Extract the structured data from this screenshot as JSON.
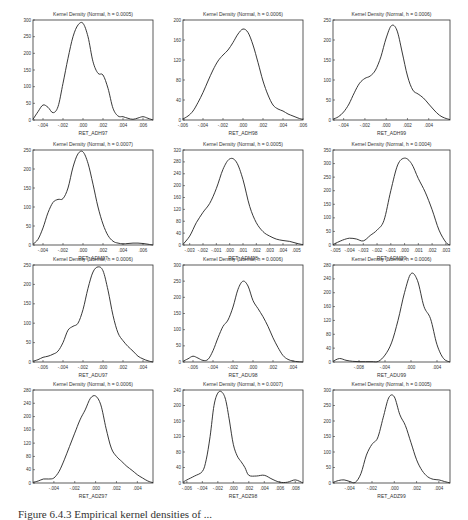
{
  "caption": "Figure 6.4.3 Empirical kernel densities of ...",
  "chart_data": [
    {
      "type": "line",
      "title": "Kernel Density (Normal, h = 0.0005)",
      "xlabel": "RET_ADH97",
      "ylabel": "",
      "xticks": [
        "-.004",
        "-.002",
        ".000",
        ".002",
        ".004",
        ".006"
      ],
      "xlim": [
        -0.005,
        0.007
      ],
      "yticks": [
        0,
        50,
        100,
        150,
        200,
        250,
        300
      ],
      "ylim": [
        0,
        300
      ],
      "x": [
        -0.005,
        -0.0045,
        -0.004,
        -0.0035,
        -0.003,
        -0.0025,
        -0.002,
        -0.0015,
        -0.001,
        -0.0005,
        0.0,
        0.0005,
        0.001,
        0.0015,
        0.002,
        0.0025,
        0.003,
        0.0035,
        0.004,
        0.0045,
        0.005,
        0.0055,
        0.006,
        0.0065,
        0.007
      ],
      "values": [
        2,
        25,
        45,
        38,
        22,
        40,
        110,
        185,
        250,
        285,
        290,
        250,
        175,
        140,
        135,
        95,
        35,
        12,
        10,
        5,
        2,
        6,
        10,
        5,
        0
      ]
    },
    {
      "type": "line",
      "title": "Kernel Density (Normal, h = 0.0006)",
      "xlabel": "RET_ADH98",
      "ylabel": "",
      "xticks": [
        "-.006",
        "-.004",
        "-.002",
        ".000",
        ".002",
        ".004",
        ".006"
      ],
      "xlim": [
        -0.006,
        0.006
      ],
      "yticks": [
        0,
        40,
        80,
        120,
        160,
        200
      ],
      "ylim": [
        0,
        200
      ],
      "x": [
        -0.006,
        -0.0055,
        -0.005,
        -0.0045,
        -0.004,
        -0.0035,
        -0.003,
        -0.0025,
        -0.002,
        -0.0015,
        -0.001,
        -0.0005,
        0.0,
        0.0005,
        0.001,
        0.0015,
        0.002,
        0.0025,
        0.003,
        0.0035,
        0.004,
        0.0045,
        0.005,
        0.0055,
        0.006
      ],
      "values": [
        2,
        8,
        18,
        35,
        55,
        78,
        100,
        118,
        130,
        140,
        155,
        172,
        182,
        175,
        150,
        115,
        78,
        50,
        30,
        22,
        18,
        12,
        8,
        4,
        1
      ]
    },
    {
      "type": "line",
      "title": "Kernel Density (Normal, h = 0.0006)",
      "xlabel": "RET_ADH99",
      "ylabel": "",
      "xticks": [
        "-.004",
        "-.002",
        ".000",
        ".002",
        ".004"
      ],
      "xlim": [
        -0.005,
        0.006
      ],
      "yticks": [
        0,
        50,
        100,
        150,
        200,
        250
      ],
      "ylim": [
        0,
        250
      ],
      "x": [
        -0.005,
        -0.0045,
        -0.004,
        -0.0035,
        -0.003,
        -0.0025,
        -0.002,
        -0.0015,
        -0.001,
        -0.0005,
        0.0,
        0.0005,
        0.001,
        0.0015,
        0.002,
        0.0025,
        0.003,
        0.0035,
        0.004,
        0.0045,
        0.005,
        0.0055,
        0.006
      ],
      "values": [
        2,
        8,
        20,
        40,
        68,
        92,
        104,
        110,
        125,
        158,
        205,
        236,
        225,
        170,
        110,
        75,
        65,
        55,
        40,
        25,
        12,
        5,
        1
      ]
    },
    {
      "type": "line",
      "title": "Kernel Density (Normal, h = 0.0007)",
      "xlabel": "RET_ADM97",
      "ylabel": "",
      "xticks": [
        "-.004",
        "-.002",
        ".000",
        ".002",
        ".004",
        ".006"
      ],
      "xlim": [
        -0.005,
        0.007
      ],
      "yticks": [
        0,
        50,
        100,
        150,
        200,
        250
      ],
      "ylim": [
        0,
        250
      ],
      "x": [
        -0.005,
        -0.0045,
        -0.004,
        -0.0035,
        -0.003,
        -0.0025,
        -0.002,
        -0.0015,
        -0.001,
        -0.0005,
        0.0,
        0.0005,
        0.001,
        0.0015,
        0.002,
        0.0025,
        0.003,
        0.0035,
        0.004,
        0.0045,
        0.005,
        0.0055,
        0.006,
        0.0065,
        0.007
      ],
      "values": [
        2,
        15,
        45,
        85,
        112,
        120,
        122,
        150,
        205,
        240,
        245,
        215,
        160,
        100,
        55,
        25,
        10,
        5,
        3,
        4,
        5,
        5,
        4,
        2,
        0
      ]
    },
    {
      "type": "line",
      "title": "Kernel Density (Normal, h = 0.0005)",
      "xlabel": "RET_ADM98",
      "ylabel": "",
      "xticks": [
        "-.003",
        "-.002",
        "-.001",
        ".000",
        ".001",
        ".002",
        ".003",
        ".004",
        ".005"
      ],
      "xlim": [
        -0.0035,
        0.0055
      ],
      "yticks": [
        0,
        40,
        80,
        120,
        160,
        200,
        240,
        280,
        320
      ],
      "ylim": [
        0,
        320
      ],
      "x": [
        -0.0035,
        -0.003,
        -0.0025,
        -0.002,
        -0.0015,
        -0.001,
        -0.0005,
        0.0,
        0.0005,
        0.001,
        0.0015,
        0.002,
        0.0025,
        0.003,
        0.0035,
        0.004,
        0.0045,
        0.005,
        0.0055
      ],
      "values": [
        2,
        30,
        75,
        110,
        140,
        190,
        255,
        290,
        280,
        220,
        130,
        75,
        45,
        30,
        20,
        15,
        12,
        6,
        1
      ]
    },
    {
      "type": "line",
      "title": "Kernel Density (Normal, h = 0.0004)",
      "xlabel": "RET_ADM99",
      "ylabel": "",
      "xticks": [
        "-.005",
        "-.004",
        "-.003",
        "-.002",
        "-.001",
        ".000",
        ".001",
        ".002",
        ".003"
      ],
      "xlim": [
        -0.0052,
        0.0033
      ],
      "yticks": [
        0,
        50,
        100,
        150,
        200,
        250,
        300,
        350
      ],
      "ylim": [
        0,
        350
      ],
      "x": [
        -0.0052,
        -0.0045,
        -0.004,
        -0.0035,
        -0.003,
        -0.0025,
        -0.002,
        -0.0015,
        -0.001,
        -0.0005,
        0.0,
        0.0005,
        0.001,
        0.0015,
        0.002,
        0.0025,
        0.003,
        0.0033
      ],
      "values": [
        2,
        18,
        25,
        22,
        15,
        35,
        55,
        90,
        200,
        295,
        320,
        300,
        245,
        195,
        130,
        55,
        10,
        0
      ]
    },
    {
      "type": "line",
      "title": "Kernel Density (Normal, h = 0.0006)",
      "xlabel": "RET_ADU97",
      "ylabel": "",
      "xticks": [
        "-.006",
        "-.004",
        "-.002",
        ".000",
        ".002",
        ".004"
      ],
      "xlim": [
        -0.007,
        0.005
      ],
      "yticks": [
        0,
        50,
        100,
        150,
        200,
        250
      ],
      "ylim": [
        0,
        250
      ],
      "x": [
        -0.007,
        -0.0065,
        -0.006,
        -0.0055,
        -0.005,
        -0.0045,
        -0.004,
        -0.0035,
        -0.003,
        -0.0025,
        -0.002,
        -0.0015,
        -0.001,
        -0.0005,
        0.0,
        0.0005,
        0.001,
        0.0015,
        0.002,
        0.0025,
        0.003,
        0.0035,
        0.004,
        0.0045,
        0.005
      ],
      "values": [
        2,
        6,
        12,
        15,
        20,
        28,
        50,
        82,
        92,
        100,
        135,
        190,
        232,
        245,
        235,
        185,
        120,
        75,
        55,
        40,
        28,
        15,
        8,
        3,
        0
      ]
    },
    {
      "type": "line",
      "title": "Kernel Density (Normal, h = 0.0006)",
      "xlabel": "RET_ADU98",
      "ylabel": "",
      "xticks": [
        "-.006",
        "-.004",
        "-.002",
        ".000",
        ".002",
        ".004"
      ],
      "xlim": [
        -0.007,
        0.005
      ],
      "yticks": [
        0,
        50,
        100,
        150,
        200,
        250,
        300
      ],
      "ylim": [
        0,
        300
      ],
      "x": [
        -0.007,
        -0.0065,
        -0.006,
        -0.0055,
        -0.005,
        -0.0045,
        -0.004,
        -0.0035,
        -0.003,
        -0.0025,
        -0.002,
        -0.0015,
        -0.001,
        -0.0005,
        0.0,
        0.0005,
        0.001,
        0.0015,
        0.002,
        0.0025,
        0.003,
        0.0035,
        0.004,
        0.0045,
        0.005
      ],
      "values": [
        2,
        10,
        18,
        12,
        5,
        8,
        35,
        75,
        110,
        130,
        170,
        225,
        250,
        235,
        190,
        165,
        140,
        110,
        75,
        45,
        20,
        8,
        3,
        1,
        0
      ]
    },
    {
      "type": "line",
      "title": "Kernel Density (Normal, h = 0.0006)",
      "xlabel": "RET_ADU99",
      "ylabel": "",
      "xticks": [
        "-.008",
        "-.004",
        ".000",
        ".004"
      ],
      "xlim": [
        -0.012,
        0.006
      ],
      "yticks": [
        0,
        40,
        80,
        120,
        160,
        200,
        240,
        280
      ],
      "ylim": [
        0,
        280
      ],
      "x": [
        -0.012,
        -0.011,
        -0.01,
        -0.009,
        -0.008,
        -0.007,
        -0.006,
        -0.005,
        -0.004,
        -0.003,
        -0.002,
        -0.001,
        0.0,
        0.001,
        0.002,
        0.003,
        0.004,
        0.005,
        0.006
      ],
      "values": [
        2,
        10,
        5,
        2,
        1,
        1,
        1,
        2,
        20,
        55,
        120,
        200,
        255,
        235,
        160,
        125,
        50,
        10,
        0
      ]
    },
    {
      "type": "line",
      "title": "Kernel Density (Normal, h = 0.0006)",
      "xlabel": "RET_ADZ97",
      "ylabel": "",
      "xticks": [
        "-.004",
        "-.002",
        ".000",
        ".002",
        ".004"
      ],
      "xlim": [
        -0.006,
        0.0055
      ],
      "yticks": [
        0,
        40,
        80,
        120,
        160,
        200,
        240,
        280
      ],
      "ylim": [
        0,
        280
      ],
      "x": [
        -0.006,
        -0.0055,
        -0.005,
        -0.0045,
        -0.004,
        -0.0035,
        -0.003,
        -0.0025,
        -0.002,
        -0.0015,
        -0.001,
        -0.0005,
        0.0,
        0.0005,
        0.001,
        0.0015,
        0.002,
        0.0025,
        0.003,
        0.0035,
        0.004,
        0.0045,
        0.005,
        0.0055
      ],
      "values": [
        2,
        6,
        12,
        12,
        15,
        35,
        70,
        110,
        150,
        190,
        220,
        255,
        262,
        235,
        165,
        105,
        80,
        65,
        50,
        38,
        25,
        15,
        6,
        1
      ]
    },
    {
      "type": "line",
      "title": "Kernel Density (Normal, h = 0.0007)",
      "xlabel": "RET_ADZ98",
      "ylabel": "",
      "xticks": [
        "-.006",
        "-.004",
        "-.002",
        ".000",
        ".002",
        ".004",
        ".006",
        ".008"
      ],
      "xlim": [
        -0.0065,
        0.009
      ],
      "yticks": [
        0,
        40,
        80,
        120,
        160,
        200,
        240
      ],
      "ylim": [
        0,
        240
      ],
      "x": [
        -0.0065,
        -0.006,
        -0.005,
        -0.004,
        -0.0035,
        -0.003,
        -0.0025,
        -0.002,
        -0.0015,
        -0.001,
        -0.0005,
        0.0,
        0.0005,
        0.001,
        0.0015,
        0.002,
        0.003,
        0.004,
        0.005,
        0.006,
        0.007,
        0.008,
        0.009
      ],
      "values": [
        2,
        8,
        18,
        30,
        60,
        120,
        200,
        232,
        235,
        215,
        160,
        100,
        70,
        55,
        40,
        20,
        18,
        20,
        10,
        2,
        2,
        8,
        0
      ]
    },
    {
      "type": "line",
      "title": "Kernel Density (Normal, h = 0.0005)",
      "xlabel": "RET_ADZ99",
      "ylabel": "",
      "xticks": [
        "-.004",
        "-.002",
        ".000",
        ".002",
        ".004"
      ],
      "xlim": [
        -0.0055,
        0.005
      ],
      "yticks": [
        0,
        50,
        100,
        150,
        200,
        250,
        300
      ],
      "ylim": [
        0,
        300
      ],
      "x": [
        -0.0055,
        -0.005,
        -0.0045,
        -0.004,
        -0.0035,
        -0.003,
        -0.0025,
        -0.002,
        -0.0015,
        -0.001,
        -0.0005,
        0.0,
        0.0005,
        0.001,
        0.0015,
        0.002,
        0.0025,
        0.003,
        0.0035,
        0.004,
        0.0045,
        0.005
      ],
      "values": [
        2,
        8,
        10,
        5,
        2,
        30,
        90,
        125,
        145,
        210,
        275,
        278,
        220,
        185,
        130,
        75,
        40,
        20,
        12,
        10,
        5,
        0
      ]
    }
  ]
}
